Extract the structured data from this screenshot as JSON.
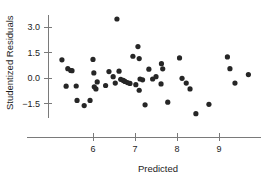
{
  "chart_data": {
    "type": "scatter",
    "title": "",
    "xlabel": "Predicted",
    "ylabel": "Studentized Residuals",
    "xticks": [
      6,
      7,
      8,
      9
    ],
    "xticklabels": [
      "6",
      "7",
      "8",
      "9"
    ],
    "yticks": [
      3.0,
      1.5,
      0.0,
      -1.5
    ],
    "yticklabels": [
      "3.0",
      "1.5",
      "0.0",
      "-1.5"
    ],
    "xlim": [
      5.0,
      9.9
    ],
    "ylim": [
      -2.6,
      3.8
    ],
    "grid": false,
    "legend": null,
    "marker": "filled-circle",
    "marker_color": "#262626",
    "axis_color": "#7a7a7a",
    "points": [
      {
        "x": 5.26,
        "y": 1.07
      },
      {
        "x": 5.4,
        "y": 0.55
      },
      {
        "x": 5.47,
        "y": 0.44
      },
      {
        "x": 5.5,
        "y": 0.43
      },
      {
        "x": 5.36,
        "y": -0.48
      },
      {
        "x": 5.6,
        "y": -0.47
      },
      {
        "x": 5.62,
        "y": -1.32
      },
      {
        "x": 5.79,
        "y": -1.62
      },
      {
        "x": 5.93,
        "y": -1.32
      },
      {
        "x": 6.0,
        "y": 1.09
      },
      {
        "x": 6.02,
        "y": 0.3
      },
      {
        "x": 6.03,
        "y": -0.52
      },
      {
        "x": 6.07,
        "y": -0.64
      },
      {
        "x": 6.1,
        "y": -0.23
      },
      {
        "x": 6.3,
        "y": -0.44
      },
      {
        "x": 6.38,
        "y": 0.38
      },
      {
        "x": 6.57,
        "y": 3.47
      },
      {
        "x": 6.48,
        "y": 0.08
      },
      {
        "x": 6.53,
        "y": -0.3
      },
      {
        "x": 6.62,
        "y": 0.4
      },
      {
        "x": 6.66,
        "y": -0.08
      },
      {
        "x": 6.72,
        "y": -0.14
      },
      {
        "x": 6.76,
        "y": -0.2
      },
      {
        "x": 6.82,
        "y": -0.27
      },
      {
        "x": 6.88,
        "y": -0.32
      },
      {
        "x": 6.95,
        "y": 1.28
      },
      {
        "x": 7.07,
        "y": 1.85
      },
      {
        "x": 7.1,
        "y": 1.14
      },
      {
        "x": 7.02,
        "y": -0.39
      },
      {
        "x": 7.12,
        "y": -0.06
      },
      {
        "x": 7.18,
        "y": -0.11
      },
      {
        "x": 7.1,
        "y": -0.72
      },
      {
        "x": 7.24,
        "y": -1.58
      },
      {
        "x": 7.33,
        "y": 0.52
      },
      {
        "x": 7.42,
        "y": -0.06
      },
      {
        "x": 7.5,
        "y": 0.08
      },
      {
        "x": 7.63,
        "y": 0.84
      },
      {
        "x": 7.66,
        "y": 0.54
      },
      {
        "x": 7.62,
        "y": -0.35
      },
      {
        "x": 7.78,
        "y": -1.42
      },
      {
        "x": 8.06,
        "y": 1.18
      },
      {
        "x": 8.12,
        "y": -0.02
      },
      {
        "x": 8.22,
        "y": -0.3
      },
      {
        "x": 8.31,
        "y": -0.64
      },
      {
        "x": 8.45,
        "y": -2.1
      },
      {
        "x": 8.76,
        "y": -1.55
      },
      {
        "x": 9.2,
        "y": 1.24
      },
      {
        "x": 9.26,
        "y": 0.55
      },
      {
        "x": 9.38,
        "y": -0.3
      },
      {
        "x": 9.7,
        "y": 0.2
      }
    ]
  }
}
